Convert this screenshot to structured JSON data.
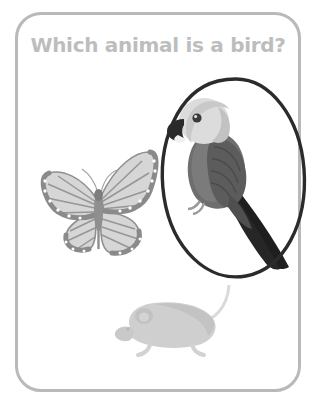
{
  "card": {
    "border_color": "#b9b9b9",
    "background_color": "#ffffff",
    "corner_radius_px": 26
  },
  "question": {
    "text": "Which animal is a bird?",
    "color": "#bdbdbd",
    "align": "center"
  },
  "answers": [
    {
      "id": "butterfly",
      "label": "butterfly",
      "icon": "butterfly-icon",
      "selected": false,
      "position": {
        "x": 14,
        "y": 134,
        "width": 130,
        "height": 112
      },
      "colors": {
        "wing_fill": "#d6d6d6",
        "wing_vein": "#8c8c8c",
        "wing_border": "#9a9a9a",
        "spot": "#ffffff",
        "body": "#8f8f8f"
      }
    },
    {
      "id": "parrot",
      "label": "parrot",
      "icon": "parrot-icon",
      "selected": true,
      "position": {
        "x": 138,
        "y": 62,
        "width": 140,
        "height": 200
      },
      "colors": {
        "head": "#dcdcdc",
        "head_shadow": "#c2c2c2",
        "body": "#6e6e6e",
        "wing": "#5c5c5c",
        "tail": "#1e1e1e",
        "beak": "#2a2a2a",
        "eye": "#3a3a3a"
      }
    },
    {
      "id": "mouse",
      "label": "mouse",
      "icon": "mouse-icon",
      "selected": false,
      "position": {
        "x": 88,
        "y": 270,
        "width": 130,
        "height": 85
      },
      "colors": {
        "body": "#cfcfcf",
        "body_shade": "#c0c0c0",
        "ear": "#c9c9c9",
        "tail": "#d9d9d9"
      }
    }
  ],
  "selection_mark": {
    "type": "hand-drawn-oval",
    "target": "parrot",
    "color": "#2b2b2b",
    "stroke_width_px": 3,
    "position": {
      "x": 132,
      "y": 58,
      "width": 162,
      "height": 210
    },
    "rotation_deg": -8
  }
}
